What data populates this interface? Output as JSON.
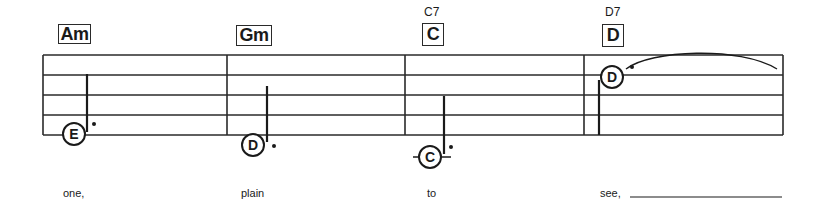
{
  "measures": [
    {
      "chord": "Am",
      "chord_alt": "",
      "note": "E",
      "lyric": "one,"
    },
    {
      "chord": "Gm",
      "chord_alt": "",
      "note": "D",
      "lyric": "plain"
    },
    {
      "chord": "C",
      "chord_alt": "C7",
      "note": "C",
      "lyric": "to"
    },
    {
      "chord": "D",
      "chord_alt": "D7",
      "note": "D",
      "lyric": "see,"
    }
  ],
  "staff": {
    "line_count": 5,
    "ink_color": "#1a1a1a"
  }
}
